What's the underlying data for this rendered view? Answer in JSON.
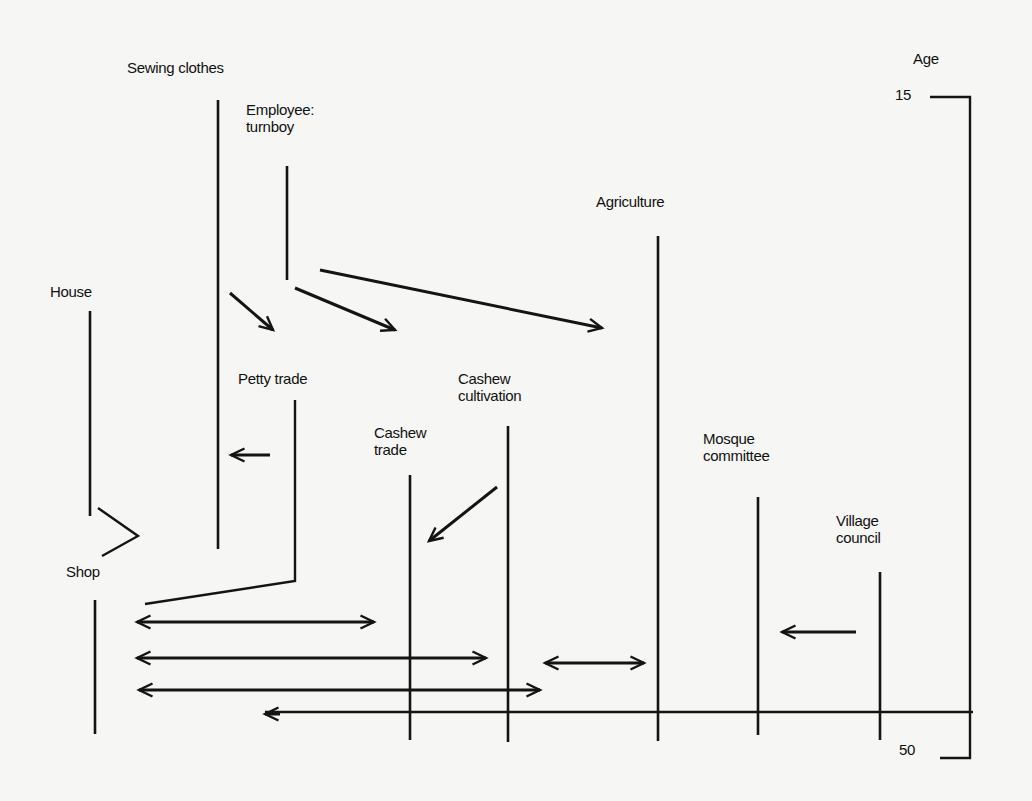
{
  "diagram": {
    "axis": {
      "label": "Age",
      "start_label": "15",
      "end_label": "50"
    },
    "labels": [
      {
        "id": "sewing-clothes",
        "text": "Sewing clothes",
        "x": 127,
        "y": 59
      },
      {
        "id": "employee-turnboy",
        "text": "Employee:\nturnboy",
        "x": 246,
        "y": 101
      },
      {
        "id": "house",
        "text": "House",
        "x": 50,
        "y": 283
      },
      {
        "id": "petty-trade",
        "text": "Petty trade",
        "x": 238,
        "y": 370
      },
      {
        "id": "cashew-cultivation",
        "text": "Cashew\ncultivation",
        "x": 458,
        "y": 370
      },
      {
        "id": "cashew-trade",
        "text": "Cashew\ntrade",
        "x": 374,
        "y": 424
      },
      {
        "id": "agriculture",
        "text": "Agriculture",
        "x": 596,
        "y": 193
      },
      {
        "id": "mosque-committee",
        "text": "Mosque\ncommittee",
        "x": 703,
        "y": 430
      },
      {
        "id": "village-council",
        "text": "Village\ncouncil",
        "x": 836,
        "y": 512
      },
      {
        "id": "shop",
        "text": "Shop",
        "x": 66,
        "y": 563
      },
      {
        "id": "age-title",
        "text": "Age",
        "x": 913,
        "y": 50
      },
      {
        "id": "age-15",
        "text": "15",
        "x": 895,
        "y": 86
      },
      {
        "id": "age-50",
        "text": "50",
        "x": 899,
        "y": 741
      }
    ],
    "timelines": [
      {
        "id": "sewing-clothes",
        "x": 218,
        "y1": 100,
        "y2": 549
      },
      {
        "id": "employee-turnboy",
        "x": 287,
        "y1": 166,
        "y2": 280
      },
      {
        "id": "house",
        "x": 90,
        "y1": 311,
        "y2": 516
      },
      {
        "id": "shop",
        "x": 95,
        "y1": 600,
        "y2": 734
      },
      {
        "id": "cashew-trade",
        "x": 410,
        "y1": 475,
        "y2": 740
      },
      {
        "id": "cashew-cultivation",
        "x": 508,
        "y1": 426,
        "y2": 742
      },
      {
        "id": "agriculture",
        "x": 658,
        "y1": 236,
        "y2": 741
      },
      {
        "id": "mosque-committee",
        "x": 758,
        "y1": 497,
        "y2": 735
      },
      {
        "id": "village-council",
        "x": 880,
        "y1": 572,
        "y2": 740
      }
    ],
    "paths": [
      {
        "id": "petty-trade-to-shop",
        "points": "295,400 295,581 145,604"
      },
      {
        "id": "house-to-shop-bend",
        "points": "98,508 138,536 102,556"
      },
      {
        "id": "age-bracket",
        "points": "930,97 970,97 970,758 940,758"
      },
      {
        "id": "baseline",
        "points": "265,712 973,712"
      }
    ],
    "arrows": [
      {
        "id": "sewing-to-petty-trade",
        "x1": 230,
        "y1": 293,
        "x2": 273,
        "y2": 330,
        "head": "end"
      },
      {
        "id": "turnboy-to-cashew-trade",
        "x1": 295,
        "y1": 288,
        "x2": 395,
        "y2": 330,
        "head": "end"
      },
      {
        "id": "turnboy-to-agriculture",
        "x1": 320,
        "y1": 270,
        "x2": 602,
        "y2": 328,
        "head": "end"
      },
      {
        "id": "petty-trade-to-sewing",
        "x1": 270,
        "y1": 455,
        "x2": 231,
        "y2": 455,
        "head": "end"
      },
      {
        "id": "cultivation-to-cashew-trade",
        "x1": 497,
        "y1": 487,
        "x2": 429,
        "y2": 541,
        "head": "end"
      },
      {
        "id": "shop-cashew-trade",
        "x1": 137,
        "y1": 622,
        "x2": 374,
        "y2": 622,
        "head": "both"
      },
      {
        "id": "shop-cashew-cultivation",
        "x1": 137,
        "y1": 658,
        "x2": 486,
        "y2": 658,
        "head": "both"
      },
      {
        "id": "shop-agriculture",
        "x1": 139,
        "y1": 690,
        "x2": 540,
        "y2": 690,
        "head": "both"
      },
      {
        "id": "shop-baseline",
        "x1": 265,
        "y1": 714,
        "x2": 280,
        "y2": 714,
        "head": "start"
      },
      {
        "id": "cultivation-agriculture",
        "x1": 545,
        "y1": 663,
        "x2": 644,
        "y2": 663,
        "head": "both"
      },
      {
        "id": "village-council-to-mosque",
        "x1": 856,
        "y1": 632,
        "x2": 782,
        "y2": 632,
        "head": "end"
      }
    ],
    "colors": {
      "ink": "#141414",
      "paper": "#f6f6f4"
    }
  }
}
